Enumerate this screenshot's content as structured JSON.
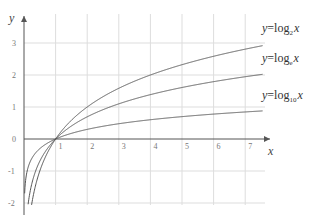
{
  "chart_data": {
    "type": "line",
    "title": "",
    "xlabel": "x",
    "ylabel": "y",
    "xlim": [
      0,
      7.5
    ],
    "ylim": [
      -2,
      3.5
    ],
    "grid": true,
    "x_ticks": [
      "1",
      "2",
      "3",
      "4",
      "5",
      "6",
      "7"
    ],
    "y_ticks": [
      "3",
      "2",
      "1",
      "0",
      "-1",
      "-2"
    ],
    "series": [
      {
        "name": "y=log2 x",
        "base": 2,
        "label_main": "y=log",
        "label_sub": "2",
        "label_var": "x"
      },
      {
        "name": "y=loge x",
        "base": 2.718281828,
        "label_main": "y=log",
        "label_sub": "e",
        "label_var": "x"
      },
      {
        "name": "y=log10 x",
        "base": 10,
        "label_main": "y=log",
        "label_sub": "10",
        "label_var": "x"
      }
    ]
  },
  "colors": {
    "grid": "#dddddd",
    "axis": "#555555",
    "curve": "#555555"
  }
}
